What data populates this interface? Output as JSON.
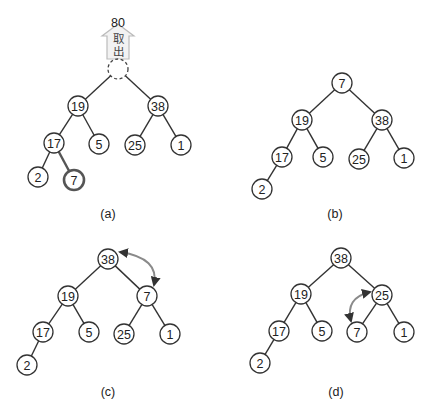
{
  "colors": {
    "node_stroke": "#333333",
    "highlight_stroke": "#555555",
    "swap_arrow": "#8a8a8a",
    "annotation_arrow": "#cccccc"
  },
  "panels": [
    {
      "id": "a",
      "label": "(a)",
      "label_pos": [
        108,
        218
      ],
      "annotation": {
        "value": "80",
        "text_line1": "取",
        "text_line2": "出",
        "x": 118,
        "y": 22
      },
      "nodes": [
        {
          "id": "root",
          "value": "",
          "x": 118,
          "y": 69,
          "style": "dashed"
        },
        {
          "id": "n19",
          "value": "19",
          "x": 78,
          "y": 106
        },
        {
          "id": "n38",
          "value": "38",
          "x": 158,
          "y": 106
        },
        {
          "id": "n17",
          "value": "17",
          "x": 54,
          "y": 143
        },
        {
          "id": "n5",
          "value": "5",
          "x": 99,
          "y": 144
        },
        {
          "id": "n25",
          "value": "25",
          "x": 135,
          "y": 145
        },
        {
          "id": "n1",
          "value": "1",
          "x": 181,
          "y": 145
        },
        {
          "id": "n2",
          "value": "2",
          "x": 38,
          "y": 177
        },
        {
          "id": "n7",
          "value": "7",
          "x": 74,
          "y": 180,
          "style": "bold"
        }
      ],
      "edges": [
        [
          "root",
          "n19"
        ],
        [
          "root",
          "n38"
        ],
        [
          "n19",
          "n17"
        ],
        [
          "n19",
          "n5"
        ],
        [
          "n38",
          "n25"
        ],
        [
          "n38",
          "n1"
        ],
        [
          "n17",
          "n2"
        ],
        [
          "n17",
          "n7",
          "bold"
        ]
      ]
    },
    {
      "id": "b",
      "label": "(b)",
      "label_pos": [
        335,
        218
      ],
      "nodes": [
        {
          "id": "n7",
          "value": "7",
          "x": 342,
          "y": 83
        },
        {
          "id": "n19",
          "value": "19",
          "x": 302,
          "y": 120
        },
        {
          "id": "n38",
          "value": "38",
          "x": 382,
          "y": 120
        },
        {
          "id": "n17",
          "value": "17",
          "x": 282,
          "y": 157
        },
        {
          "id": "n5",
          "value": "5",
          "x": 323,
          "y": 157
        },
        {
          "id": "n25",
          "value": "25",
          "x": 359,
          "y": 159
        },
        {
          "id": "n1",
          "value": "1",
          "x": 404,
          "y": 158
        },
        {
          "id": "n2",
          "value": "2",
          "x": 262,
          "y": 189
        }
      ],
      "edges": [
        [
          "n7",
          "n19"
        ],
        [
          "n7",
          "n38"
        ],
        [
          "n19",
          "n17"
        ],
        [
          "n19",
          "n5"
        ],
        [
          "n38",
          "n25"
        ],
        [
          "n38",
          "n1"
        ],
        [
          "n17",
          "n2"
        ]
      ]
    },
    {
      "id": "c",
      "label": "(c)",
      "label_pos": [
        108,
        396
      ],
      "swap": {
        "from": "n38",
        "to": "n7",
        "path": "M120,252 Q160,258 154,285"
      },
      "nodes": [
        {
          "id": "n38",
          "value": "38",
          "x": 108,
          "y": 259
        },
        {
          "id": "n19",
          "value": "19",
          "x": 68,
          "y": 296
        },
        {
          "id": "n7",
          "value": "7",
          "x": 147,
          "y": 296
        },
        {
          "id": "n17",
          "value": "17",
          "x": 43,
          "y": 332
        },
        {
          "id": "n5",
          "value": "5",
          "x": 89,
          "y": 332
        },
        {
          "id": "n25",
          "value": "25",
          "x": 124,
          "y": 334
        },
        {
          "id": "n1",
          "value": "1",
          "x": 170,
          "y": 334
        },
        {
          "id": "n2",
          "value": "2",
          "x": 27,
          "y": 365
        }
      ],
      "edges": [
        [
          "n38",
          "n19"
        ],
        [
          "n38",
          "n7"
        ],
        [
          "n19",
          "n17"
        ],
        [
          "n19",
          "n5"
        ],
        [
          "n7",
          "n25"
        ],
        [
          "n7",
          "n1"
        ],
        [
          "n17",
          "n2"
        ]
      ]
    },
    {
      "id": "d",
      "label": "(d)",
      "label_pos": [
        336,
        396
      ],
      "swap": {
        "from": "n25",
        "to": "n7",
        "path": "M370,292 Q345,298 351,321"
      },
      "nodes": [
        {
          "id": "n38",
          "value": "38",
          "x": 341,
          "y": 258
        },
        {
          "id": "n19",
          "value": "19",
          "x": 301,
          "y": 294
        },
        {
          "id": "n25",
          "value": "25",
          "x": 382,
          "y": 295
        },
        {
          "id": "n17",
          "value": "17",
          "x": 279,
          "y": 331
        },
        {
          "id": "n5",
          "value": "5",
          "x": 322,
          "y": 331
        },
        {
          "id": "n7",
          "value": "7",
          "x": 357,
          "y": 332
        },
        {
          "id": "n1",
          "value": "1",
          "x": 404,
          "y": 332
        },
        {
          "id": "n2",
          "value": "2",
          "x": 260,
          "y": 363
        }
      ],
      "edges": [
        [
          "n38",
          "n19"
        ],
        [
          "n38",
          "n25"
        ],
        [
          "n19",
          "n17"
        ],
        [
          "n19",
          "n5"
        ],
        [
          "n25",
          "n7"
        ],
        [
          "n25",
          "n1"
        ],
        [
          "n17",
          "n2"
        ]
      ]
    }
  ]
}
